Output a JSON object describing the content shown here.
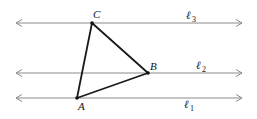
{
  "diagram": {
    "lines": [
      {
        "name": "l3",
        "label": "ℓ",
        "sub": "3",
        "y": 23
      },
      {
        "name": "l2",
        "label": "ℓ",
        "sub": "2",
        "y": 73
      },
      {
        "name": "l1",
        "label": "ℓ",
        "sub": "1",
        "y": 98
      }
    ],
    "points": {
      "A": {
        "label": "A",
        "x": 77,
        "y": 98
      },
      "B": {
        "label": "B",
        "x": 148,
        "y": 73
      },
      "C": {
        "label": "C",
        "x": 92,
        "y": 23
      }
    },
    "line_color": "#8a8a8a",
    "triangle_color": "#1a1a1a"
  }
}
